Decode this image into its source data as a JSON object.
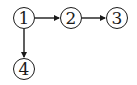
{
  "diagram": {
    "nodes": [
      {
        "id": "n1",
        "label": "1",
        "cx": 24,
        "cy": 18
      },
      {
        "id": "n2",
        "label": "2",
        "cx": 71,
        "cy": 18
      },
      {
        "id": "n3",
        "label": "3",
        "cx": 117,
        "cy": 18
      },
      {
        "id": "n4",
        "label": "4",
        "cx": 24,
        "cy": 69
      }
    ],
    "edges": [
      {
        "from": "1",
        "to": "2"
      },
      {
        "from": "2",
        "to": "3"
      },
      {
        "from": "1",
        "to": "4"
      }
    ],
    "colors": {
      "stroke": "#1a1a1a",
      "background": "#ffffff"
    }
  }
}
